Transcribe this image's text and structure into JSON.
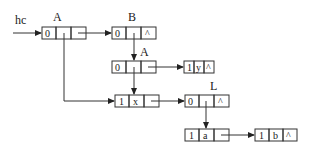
{
  "head_pointer": {
    "label": "hc"
  },
  "nodes": [
    {
      "id": "A1",
      "label": "A",
      "cells": [
        "0",
        "",
        ""
      ],
      "x": 42,
      "y": 27,
      "w": [
        14,
        15,
        15
      ]
    },
    {
      "id": "B",
      "label": "B",
      "cells": [
        "0",
        "",
        "^"
      ],
      "x": 112,
      "y": 27,
      "w": [
        14,
        15,
        15
      ]
    },
    {
      "id": "A2",
      "label": "A",
      "cells": [
        "0",
        "",
        ""
      ],
      "x": 112,
      "y": 61,
      "w": [
        14,
        15,
        15
      ]
    },
    {
      "id": "Y",
      "label": "",
      "cells": [
        "1",
        "y",
        "^"
      ],
      "x": 184,
      "y": 61,
      "w": [
        10,
        10,
        10
      ]
    },
    {
      "id": "X",
      "label": "",
      "cells": [
        "1",
        "x",
        ""
      ],
      "x": 115,
      "y": 95,
      "w": [
        14,
        15,
        15
      ]
    },
    {
      "id": "L",
      "label": "L",
      "cells": [
        "0",
        "",
        "^"
      ],
      "x": 185,
      "y": 95,
      "w": [
        14,
        15,
        15
      ]
    },
    {
      "id": "Aa",
      "label": "",
      "cells": [
        "1",
        "a",
        ""
      ],
      "x": 185,
      "y": 129,
      "w": [
        14,
        15,
        15
      ]
    },
    {
      "id": "Bb",
      "label": "",
      "cells": [
        "1",
        "b",
        "^"
      ],
      "x": 255,
      "y": 129,
      "w": [
        14,
        14,
        14
      ]
    }
  ],
  "labels": {
    "hc": "hc",
    "A1": "A",
    "B": "B",
    "A2": "A",
    "L": "L"
  },
  "cells_text": {
    "A1": [
      "0",
      "",
      ""
    ],
    "B": [
      "0",
      "",
      "^"
    ],
    "A2": [
      "0",
      "",
      ""
    ],
    "Y": [
      "1",
      "y",
      "^"
    ],
    "X": [
      "1",
      "x",
      ""
    ],
    "L": [
      "0",
      "",
      "^"
    ],
    "Aa": [
      "1",
      "a",
      ""
    ],
    "Bb": [
      "1",
      "b",
      "^"
    ]
  },
  "edges": [
    {
      "from": "hc",
      "to": "A1",
      "type": "head"
    },
    {
      "from": "A1.tp",
      "to": "B",
      "type": "next"
    },
    {
      "from": "A1.hp",
      "to": "X",
      "type": "sublist"
    },
    {
      "from": "B.hp",
      "to": "A2",
      "type": "sublist"
    },
    {
      "from": "A2.tp",
      "to": "Y",
      "type": "next"
    },
    {
      "from": "A2.hp",
      "to": "X",
      "type": "sublist"
    },
    {
      "from": "X.tp",
      "to": "L",
      "type": "next"
    },
    {
      "from": "L.hp",
      "to": "Aa",
      "type": "sublist"
    },
    {
      "from": "Aa.tp",
      "to": "Bb",
      "type": "next"
    }
  ]
}
